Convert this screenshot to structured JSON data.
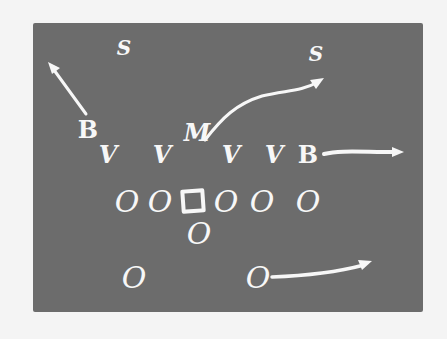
{
  "diagram": {
    "type": "football-play-diagram",
    "colors": {
      "board": "#6c6c6c",
      "ink": "#f7f7f7",
      "background": "#f4f4f4"
    },
    "defense": {
      "safeties": [
        {
          "label": "S",
          "x": 124,
          "y": 48
        },
        {
          "label": "S",
          "x": 316,
          "y": 54
        }
      ],
      "backers": [
        {
          "label": "B",
          "x": 88,
          "y": 130
        },
        {
          "label": "B",
          "x": 308,
          "y": 155
        }
      ],
      "middle_backer": {
        "label": "M",
        "x": 197,
        "y": 133
      },
      "linemen": [
        {
          "label": "V",
          "x": 108,
          "y": 155
        },
        {
          "label": "V",
          "x": 162,
          "y": 155
        },
        {
          "label": "V",
          "x": 231,
          "y": 155
        },
        {
          "label": "V",
          "x": 274,
          "y": 155
        }
      ]
    },
    "offense": {
      "line": [
        {
          "label": "O",
          "x": 127,
          "y": 202
        },
        {
          "label": "O",
          "x": 160,
          "y": 202
        },
        {
          "label": "O",
          "x": 226,
          "y": 202
        },
        {
          "label": "O",
          "x": 262,
          "y": 202
        }
      ],
      "center": {
        "label": "□",
        "x": 193,
        "y": 201
      },
      "tight_end": {
        "label": "O",
        "x": 308,
        "y": 202
      },
      "quarterback": {
        "label": "O",
        "x": 199,
        "y": 234
      },
      "backs": [
        {
          "label": "O",
          "x": 134,
          "y": 278
        },
        {
          "label": "O",
          "x": 258,
          "y": 278
        }
      ]
    },
    "routes": [
      {
        "from": "B-left",
        "direction": "up-left"
      },
      {
        "from": "M",
        "direction": "up-right"
      },
      {
        "from": "B-right",
        "direction": "right"
      },
      {
        "from": "O-back-right",
        "direction": "right"
      }
    ]
  }
}
